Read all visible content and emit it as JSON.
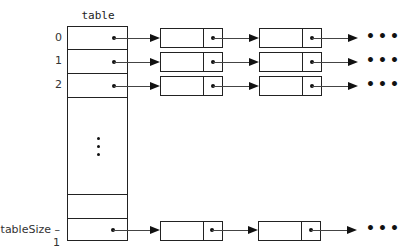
{
  "diagram": {
    "type": "hash-table-separate-chaining",
    "table_label": "table",
    "rows": [
      {
        "index_label": "0",
        "has_chain": true,
        "chain_nodes": 2,
        "continues": true
      },
      {
        "index_label": "1",
        "has_chain": true,
        "chain_nodes": 2,
        "continues": true
      },
      {
        "index_label": "2",
        "has_chain": true,
        "chain_nodes": 2,
        "continues": true
      },
      {
        "index_label": "",
        "has_chain": false
      },
      {
        "index_label": "tableSize – 1",
        "has_chain": true,
        "chain_nodes": 2,
        "continues": true
      }
    ],
    "vertical_ellipsis": "⋮",
    "continuation_symbol": "…",
    "labels": {
      "row0": "0",
      "row1": "1",
      "row2": "2",
      "last": "tableSize – 1",
      "more": "•••"
    },
    "colors": {
      "line": "#222222",
      "background": "#ffffff"
    }
  }
}
